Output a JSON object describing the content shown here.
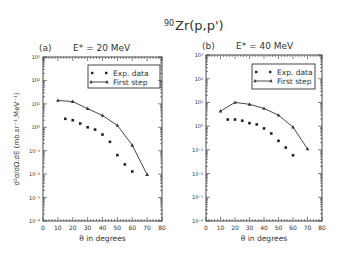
{
  "figure": {
    "title_prefix": "90",
    "title_main": "Zr(p,p')"
  },
  "chart_data": [
    {
      "type": "scatter",
      "panel_label": "(a)",
      "title": "E* = 20 MeV",
      "xlabel": "θ in degrees",
      "ylabel": "d²σ/dΩ.dE (mb.sr⁻¹.MeV⁻¹)",
      "xlim": [
        0,
        80
      ],
      "ylim": [
        0.0001,
        1000
      ],
      "yscale": "log",
      "xticks": [
        0,
        10,
        20,
        30,
        40,
        50,
        60,
        70,
        80
      ],
      "yticks": [
        "10⁻⁴",
        "10⁻³",
        "10⁻²",
        "10⁻¹",
        "10⁰",
        "10¹",
        "10²",
        "10³"
      ],
      "grid": false,
      "legend_position": "upper right",
      "legend": [
        "Exp. data",
        "First step"
      ],
      "series": [
        {
          "name": "Exp. data",
          "style": "dots",
          "x": [
            15,
            20,
            25,
            30,
            35,
            40,
            45,
            50,
            55,
            60
          ],
          "y": [
            2.3,
            2.0,
            1.45,
            1.0,
            0.8,
            0.49,
            0.24,
            0.065,
            0.026,
            0.013
          ]
        },
        {
          "name": "First step",
          "style": "line-triangles",
          "x": [
            10,
            20,
            30,
            40,
            50,
            60,
            70
          ],
          "y": [
            14,
            12.5,
            6.3,
            3.2,
            1.2,
            0.17,
            0.0096
          ]
        }
      ]
    },
    {
      "type": "scatter",
      "panel_label": "(b)",
      "title": "E* = 40 MeV",
      "xlabel": "θ in degrees",
      "ylabel": "",
      "xlim": [
        0,
        80
      ],
      "ylim": [
        0.0001,
        1000
      ],
      "yscale": "log",
      "xticks": [
        0,
        10,
        20,
        30,
        40,
        50,
        60,
        70,
        80
      ],
      "yticks": [
        "10⁻⁴",
        "10⁻³",
        "10⁻²",
        "10⁻¹",
        "10⁰",
        "10¹",
        "10²",
        "10³"
      ],
      "grid": false,
      "legend_position": "upper right",
      "legend": [
        "Exp. data",
        "First step"
      ],
      "series": [
        {
          "name": "Exp. data",
          "style": "dots",
          "x": [
            15,
            20,
            25,
            30,
            35,
            40,
            45,
            50,
            55,
            60
          ],
          "y": [
            1.9,
            1.9,
            1.7,
            1.34,
            1.18,
            0.8,
            0.49,
            0.24,
            0.125,
            0.059
          ]
        },
        {
          "name": "First step",
          "style": "line-triangles",
          "x": [
            10,
            20,
            30,
            40,
            50,
            60,
            70
          ],
          "y": [
            4.3,
            10,
            8.3,
            5.6,
            2.9,
            0.91,
            0.11
          ]
        }
      ]
    }
  ]
}
